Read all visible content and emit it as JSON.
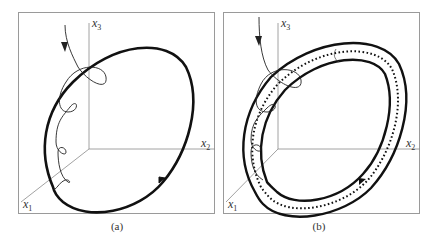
{
  "figure": {
    "panels": [
      {
        "id": "a",
        "caption": "(a)",
        "description": "Trajectory spiraling onto a closed orbit (limit cycle) in 3D phase space",
        "axes": {
          "x1": "x",
          "x1_sub": "1",
          "x2": "x",
          "x2_sub": "2",
          "x3": "x",
          "x3_sub": "3"
        }
      },
      {
        "id": "b",
        "caption": "(b)",
        "description": "Same trajectory converging into a tubular neighborhood around the dotted limit cycle",
        "axes": {
          "x1": "x",
          "x1_sub": "1",
          "x2": "x",
          "x2_sub": "2",
          "x3": "x",
          "x3_sub": "3"
        }
      }
    ],
    "colors": {
      "frame": "#9a9a9a",
      "axis": "#8a8a8a",
      "orbit": "#111111",
      "trajectory": "#222222"
    }
  }
}
